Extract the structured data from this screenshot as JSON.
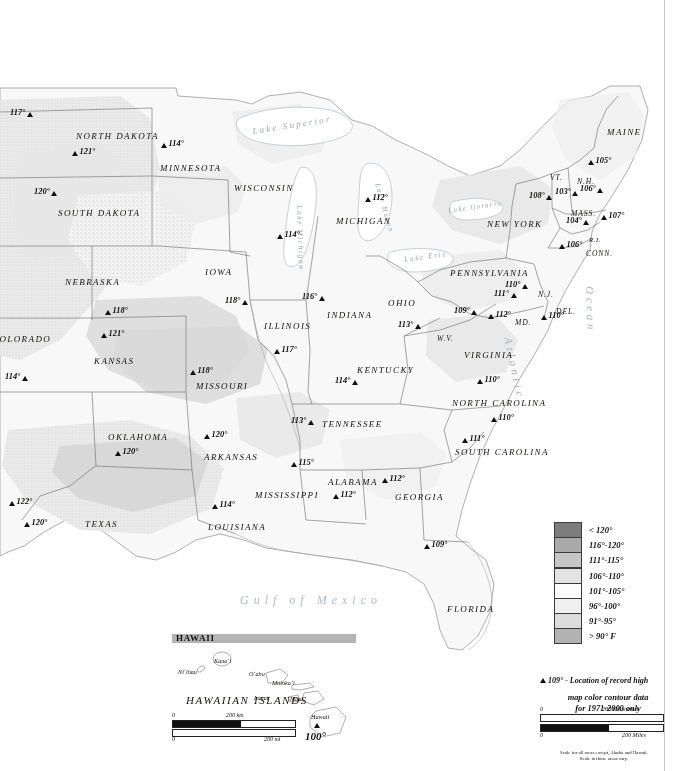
{
  "map": {
    "title": "Record High Temperatures of the United States",
    "ocean_label": "Atlantic Ocean",
    "gulf_label": "Gulf of Mexico",
    "lakes": [
      "Lake Superior",
      "Lake Michigan",
      "Lake Huron",
      "Lake Erie",
      "Lake Ontario"
    ],
    "states": [
      {
        "name": "NORTH DAKOTA",
        "x": 76,
        "y": 131,
        "size": "md"
      },
      {
        "name": "SOUTH DAKOTA",
        "x": 58,
        "y": 208,
        "size": "md"
      },
      {
        "name": "MINNESOTA",
        "x": 160,
        "y": 163,
        "size": "md"
      },
      {
        "name": "WISCONSIN",
        "x": 234,
        "y": 183,
        "size": "md"
      },
      {
        "name": "MICHIGAN",
        "x": 336,
        "y": 216,
        "size": "md"
      },
      {
        "name": "NEBRASKA",
        "x": 65,
        "y": 277,
        "size": "md"
      },
      {
        "name": "IOWA",
        "x": 205,
        "y": 267,
        "size": "md"
      },
      {
        "name": "ILLINOIS",
        "x": 264,
        "y": 321,
        "size": "md"
      },
      {
        "name": "INDIANA",
        "x": 327,
        "y": 310,
        "size": "md"
      },
      {
        "name": "OHIO",
        "x": 388,
        "y": 298,
        "size": "md"
      },
      {
        "name": "COLORADO",
        "x": -8,
        "y": 334,
        "size": "md"
      },
      {
        "name": "KANSAS",
        "x": 94,
        "y": 356,
        "size": "md"
      },
      {
        "name": "MISSOURI",
        "x": 196,
        "y": 381,
        "size": "md"
      },
      {
        "name": "KENTUCKY",
        "x": 357,
        "y": 365,
        "size": "md"
      },
      {
        "name": "W.V.",
        "x": 437,
        "y": 334,
        "size": "sm"
      },
      {
        "name": "VIRGINIA",
        "x": 464,
        "y": 350,
        "size": "md"
      },
      {
        "name": "PENNSYLVANIA",
        "x": 450,
        "y": 268,
        "size": "md"
      },
      {
        "name": "NEW YORK",
        "x": 487,
        "y": 219,
        "size": "md"
      },
      {
        "name": "MAINE",
        "x": 607,
        "y": 127,
        "size": "md"
      },
      {
        "name": "VT.",
        "x": 550,
        "y": 173,
        "size": "sm"
      },
      {
        "name": "N.H.",
        "x": 577,
        "y": 177,
        "size": "sm"
      },
      {
        "name": "MASS.",
        "x": 571,
        "y": 209,
        "size": "sm"
      },
      {
        "name": "CONN.",
        "x": 586,
        "y": 249,
        "size": "sm"
      },
      {
        "name": "R.I.",
        "x": 589,
        "y": 236,
        "size": "xs"
      },
      {
        "name": "N.J.",
        "x": 538,
        "y": 290,
        "size": "sm"
      },
      {
        "name": "DEL.",
        "x": 556,
        "y": 307,
        "size": "sm"
      },
      {
        "name": "MD.",
        "x": 515,
        "y": 318,
        "size": "sm"
      },
      {
        "name": "NORTH CAROLINA",
        "x": 452,
        "y": 398,
        "size": "md"
      },
      {
        "name": "SOUTH CAROLINA",
        "x": 455,
        "y": 447,
        "size": "md"
      },
      {
        "name": "TENNESSEE",
        "x": 322,
        "y": 419,
        "size": "md"
      },
      {
        "name": "ARKANSAS",
        "x": 204,
        "y": 452,
        "size": "md"
      },
      {
        "name": "OKLAHOMA",
        "x": 108,
        "y": 432,
        "size": "md"
      },
      {
        "name": "MISSISSIPPI",
        "x": 255,
        "y": 490,
        "size": "md"
      },
      {
        "name": "ALABAMA",
        "x": 328,
        "y": 477,
        "size": "md"
      },
      {
        "name": "GEORGIA",
        "x": 395,
        "y": 492,
        "size": "md"
      },
      {
        "name": "LOUISIANA",
        "x": 208,
        "y": 522,
        "size": "md"
      },
      {
        "name": "TEXAS",
        "x": 85,
        "y": 519,
        "size": "md"
      },
      {
        "name": "FLORIDA",
        "x": 447,
        "y": 604,
        "size": "md"
      }
    ],
    "records": [
      {
        "value": "117°",
        "x": 10,
        "y": 108,
        "tri": "right"
      },
      {
        "value": "121°",
        "x": 72,
        "y": 147,
        "tri": "left"
      },
      {
        "value": "114°",
        "x": 161,
        "y": 139,
        "tri": "left"
      },
      {
        "value": "120°",
        "x": 34,
        "y": 187,
        "tri": "right"
      },
      {
        "value": "114°",
        "x": 277,
        "y": 230,
        "tri": "left"
      },
      {
        "value": "112°",
        "x": 365,
        "y": 193,
        "tri": "left"
      },
      {
        "value": "118°",
        "x": 105,
        "y": 306,
        "tri": "left"
      },
      {
        "value": "118°",
        "x": 225,
        "y": 296,
        "tri": "right"
      },
      {
        "value": "121°",
        "x": 101,
        "y": 329,
        "tri": "left"
      },
      {
        "value": "116°",
        "x": 302,
        "y": 292,
        "tri": "right"
      },
      {
        "value": "114°",
        "x": 5,
        "y": 372,
        "tri": "right"
      },
      {
        "value": "118°",
        "x": 190,
        "y": 366,
        "tri": "left"
      },
      {
        "value": "117°",
        "x": 274,
        "y": 345,
        "tri": "left"
      },
      {
        "value": "113°",
        "x": 398,
        "y": 320,
        "tri": "right"
      },
      {
        "value": "114°",
        "x": 335,
        "y": 376,
        "tri": "right"
      },
      {
        "value": "109°",
        "x": 454,
        "y": 306,
        "tri": "right"
      },
      {
        "value": "111°",
        "x": 494,
        "y": 289,
        "tri": "right"
      },
      {
        "value": "112°",
        "x": 488,
        "y": 310,
        "tri": "left"
      },
      {
        "value": "110°",
        "x": 541,
        "y": 311,
        "tri": "left"
      },
      {
        "value": "110°",
        "x": 505,
        "y": 280,
        "tri": "right"
      },
      {
        "value": "108°",
        "x": 529,
        "y": 191,
        "tri": "right"
      },
      {
        "value": "103°",
        "x": 555,
        "y": 187,
        "tri": "right"
      },
      {
        "value": "106°",
        "x": 580,
        "y": 184,
        "tri": "right"
      },
      {
        "value": "105°",
        "x": 588,
        "y": 156,
        "tri": "left"
      },
      {
        "value": "104°",
        "x": 566,
        "y": 216,
        "tri": "right"
      },
      {
        "value": "107°",
        "x": 601,
        "y": 211,
        "tri": "left"
      },
      {
        "value": "106°",
        "x": 559,
        "y": 240,
        "tri": "left"
      },
      {
        "value": "110°",
        "x": 477,
        "y": 375,
        "tri": "left"
      },
      {
        "value": "110°",
        "x": 491,
        "y": 413,
        "tri": "left"
      },
      {
        "value": "111°",
        "x": 462,
        "y": 434,
        "tri": "left"
      },
      {
        "value": "113°",
        "x": 291,
        "y": 416,
        "tri": "right"
      },
      {
        "value": "120°",
        "x": 204,
        "y": 430,
        "tri": "left"
      },
      {
        "value": "115°",
        "x": 291,
        "y": 458,
        "tri": "left"
      },
      {
        "value": "112°",
        "x": 382,
        "y": 474,
        "tri": "left"
      },
      {
        "value": "112°",
        "x": 333,
        "y": 490,
        "tri": "left"
      },
      {
        "value": "114°",
        "x": 212,
        "y": 500,
        "tri": "left"
      },
      {
        "value": "120°",
        "x": 115,
        "y": 447,
        "tri": "left"
      },
      {
        "value": "122°",
        "x": 9,
        "y": 497,
        "tri": "left"
      },
      {
        "value": "120°",
        "x": 24,
        "y": 518,
        "tri": "left"
      },
      {
        "value": "109°",
        "x": 424,
        "y": 540,
        "tri": "left"
      }
    ]
  },
  "hawaii": {
    "bar_title": "HAWAII",
    "region_label": "HAWAIIAN ISLANDS",
    "record": "100°",
    "islands": [
      {
        "name": "Kaua‘i",
        "x": 214,
        "y": 657
      },
      {
        "name": "Ni‘ihau",
        "x": 178,
        "y": 668
      },
      {
        "name": "O‘ahu",
        "x": 249,
        "y": 670
      },
      {
        "name": "Moloka‘i",
        "x": 272,
        "y": 679
      },
      {
        "name": "Lanai",
        "x": 254,
        "y": 694
      },
      {
        "name": "Maui",
        "x": 290,
        "y": 695
      },
      {
        "name": "Hawaii",
        "x": 311,
        "y": 713
      }
    ],
    "scale": {
      "km_zero": "0",
      "km_label": "200 km",
      "mi_zero": "0",
      "mi_label": "200 mi"
    }
  },
  "legend": {
    "swatches": [
      {
        "label": "< 120°",
        "color": "#7c7c7c"
      },
      {
        "label": "116°-120°",
        "color": "#a9a9a9"
      },
      {
        "label": "111°-115°",
        "color": "#c6c6c6"
      },
      {
        "label": "106°-110°",
        "color": "#e2e2e2"
      },
      {
        "label": "101°-105°",
        "color": "#fbfbfb"
      },
      {
        "label": "96°-100°",
        "color": "#f0f0f0"
      },
      {
        "label": "91°-95°",
        "color": "#dcdcdc"
      },
      {
        "label": "> 90° F",
        "color": "#b3b3b3"
      }
    ],
    "record_note_value": "109°",
    "record_note_text": "- Location of record high",
    "source_line1": "map color contour data",
    "source_line2": "for 1971-2000 only",
    "scale": {
      "km_zero": "0",
      "km_label": "200 Kilometers",
      "mi_zero": "0",
      "mi_label": "200 Miles"
    },
    "footnote_line1": "Scale for all areas except, Alaska and Hawaii.",
    "footnote_line2": "Scale in those areas vary."
  },
  "colors": {
    "land_light": "#f7f7f7",
    "land_mid": "#ededed",
    "land_shade": "#dcdcdc",
    "border": "#6a6a6a",
    "coast": "#8d8d8d",
    "water_text": "#9aa6b0"
  }
}
